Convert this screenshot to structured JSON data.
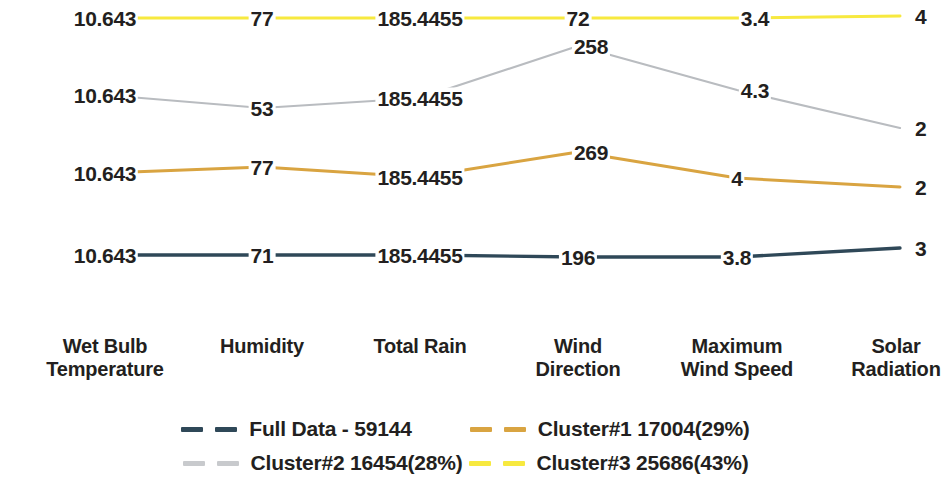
{
  "chart_data": {
    "type": "line",
    "title": "",
    "subtitle": "",
    "xlabel": "",
    "ylabel": "",
    "grid": false,
    "legend_position": "bottom",
    "axes": [
      {
        "name": "Wet Bulb Temperature",
        "label_line1": "Wet Bulb",
        "label_line2": "Temperature"
      },
      {
        "name": "Humidity",
        "label_line1": "Humidity",
        "label_line2": ""
      },
      {
        "name": "Total Rain",
        "label_line1": "Total Rain",
        "label_line2": ""
      },
      {
        "name": "Wind Direction",
        "label_line1": "Wind",
        "label_line2": "Direction"
      },
      {
        "name": "Maximum Wind Speed",
        "label_line1": "Maximum",
        "label_line2": "Wind Speed"
      },
      {
        "name": "Solar Radiation",
        "label_line1": "Solar",
        "label_line2": "Radiation"
      }
    ],
    "categories": [
      "Wet Bulb Temperature",
      "Humidity",
      "Total Rain",
      "Wind Direction",
      "Maximum Wind Speed",
      "Solar Radiation"
    ],
    "series": [
      {
        "name": "Full Data - 59144",
        "label": "Full Data - 59144",
        "count": "59144",
        "percent": "",
        "color": "#2f4858",
        "values": [
          "10.643",
          "71",
          "185.4455",
          "196",
          "3.8",
          "3"
        ],
        "last_value_clipped": "3"
      },
      {
        "name": "Cluster#1",
        "label": "Cluster#1  17004(29%)",
        "count": "17004",
        "percent": "29%",
        "color": "#d9a441",
        "values": [
          "10.643",
          "77",
          "185.4455",
          "269",
          "4",
          "2"
        ],
        "last_value_clipped": "2"
      },
      {
        "name": "Cluster#2",
        "label": "Cluster#2  16454(28%)",
        "count": "16454",
        "percent": "28%",
        "color": "#b9bcc0",
        "values": [
          "10.643",
          "53",
          "185.4455",
          "258",
          "4.3",
          "2"
        ],
        "last_value_clipped": "2"
      },
      {
        "name": "Cluster#3",
        "label": "Cluster#3  25686(43%)",
        "count": "25686",
        "percent": "43%",
        "color": "#f7e93f",
        "values": [
          "10.643",
          "77",
          "185.4455",
          "72",
          "3.4",
          "4"
        ],
        "last_value_clipped": "4"
      }
    ]
  },
  "legend": {
    "row1": [
      {
        "label": "Full Data - 59144",
        "color": "#2f4858"
      },
      {
        "label": "Cluster#1  17004(29%)",
        "color": "#d9a441"
      }
    ],
    "row2": [
      {
        "label": "Cluster#2  16454(28%)",
        "color": "#c8cacd"
      },
      {
        "label": "Cluster#3  25686(43%)",
        "color": "#f7e93f"
      }
    ]
  },
  "plot": {
    "axis_x": [
      105,
      262,
      420,
      578,
      737,
      900
    ],
    "points": {
      "full_data": [
        [
          105,
          255
        ],
        [
          262,
          255
        ],
        [
          420,
          255
        ],
        [
          578,
          257
        ],
        [
          737,
          257
        ],
        [
          900,
          248
        ]
      ],
      "cluster1": [
        [
          105,
          173
        ],
        [
          262,
          167
        ],
        [
          420,
          177
        ],
        [
          578,
          152
        ],
        [
          737,
          178
        ],
        [
          900,
          187
        ]
      ],
      "cluster2": [
        [
          105,
          95
        ],
        [
          262,
          108
        ],
        [
          420,
          98
        ],
        [
          578,
          46
        ],
        [
          737,
          90
        ],
        [
          900,
          128
        ]
      ],
      "cluster3": [
        [
          105,
          18
        ],
        [
          262,
          18
        ],
        [
          420,
          18
        ],
        [
          578,
          18
        ],
        [
          737,
          18
        ],
        [
          900,
          16
        ]
      ]
    },
    "label_positions": {
      "full_data": [
        [
          105,
          255
        ],
        [
          262,
          255
        ],
        [
          420,
          255
        ],
        [
          578,
          257
        ],
        [
          737,
          257
        ],
        [
          921,
          248
        ]
      ],
      "cluster1": [
        [
          105,
          173
        ],
        [
          262,
          167
        ],
        [
          420,
          177
        ],
        [
          591,
          152
        ],
        [
          737,
          178
        ],
        [
          921,
          187
        ]
      ],
      "cluster2": [
        [
          105,
          95
        ],
        [
          262,
          108
        ],
        [
          420,
          98
        ],
        [
          591,
          46
        ],
        [
          755,
          90
        ],
        [
          921,
          128
        ]
      ],
      "cluster3": [
        [
          105,
          18
        ],
        [
          262,
          18
        ],
        [
          420,
          18
        ],
        [
          578,
          18
        ],
        [
          755,
          18
        ],
        [
          921,
          16
        ]
      ]
    }
  }
}
